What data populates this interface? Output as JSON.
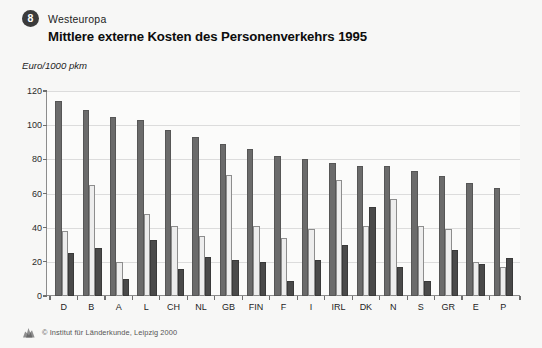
{
  "header": {
    "badge_number": "8",
    "region": "Westeuropa",
    "title": "Mittlere externe Kosten des Personenverkehrs 1995",
    "unit_label": "Euro/1000 pkm"
  },
  "legend": {
    "position": "top-right-inside",
    "items": [
      {
        "label": "Pkw",
        "color": "#6b6b6b"
      },
      {
        "label": "Bus",
        "color": "#ededed"
      },
      {
        "label": "Bahn",
        "color": "#4a4a4a"
      }
    ]
  },
  "footer": {
    "credit": "© Institut für Länderkunde, Leipzig 2000",
    "logo_name": "ifl-logo"
  },
  "chart_data": {
    "type": "bar",
    "title": "Mittlere externe Kosten des Personenverkehrs 1995",
    "subtitle": "Westeuropa",
    "xlabel": "",
    "ylabel": "Euro/1000 pkm",
    "ylim": [
      0,
      120
    ],
    "yticks": [
      0,
      20,
      40,
      60,
      80,
      100,
      120
    ],
    "grid": true,
    "categories": [
      "D",
      "B",
      "A",
      "L",
      "CH",
      "NL",
      "GB",
      "FIN",
      "F",
      "I",
      "IRL",
      "DK",
      "N",
      "S",
      "GR",
      "E",
      "P"
    ],
    "series": [
      {
        "name": "Pkw",
        "color": "#6b6b6b",
        "values": [
          114,
          109,
          105,
          103,
          97,
          93,
          89,
          86,
          82,
          80,
          78,
          76,
          76,
          73,
          70,
          66,
          63
        ]
      },
      {
        "name": "Bus",
        "color": "#ededed",
        "values": [
          38,
          65,
          20,
          48,
          41,
          35,
          71,
          41,
          34,
          39,
          68,
          41,
          57,
          41,
          39,
          20,
          17
        ]
      },
      {
        "name": "Bahn",
        "color": "#4a4a4a",
        "values": [
          25,
          28,
          10,
          33,
          16,
          23,
          21,
          20,
          9,
          21,
          30,
          52,
          17,
          9,
          27,
          19,
          22
        ]
      }
    ]
  }
}
